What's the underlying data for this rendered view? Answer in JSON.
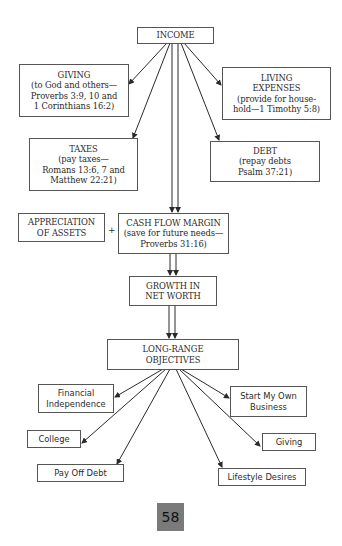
{
  "diagram": {
    "title_node": {
      "label": "INCOME"
    },
    "allocations": {
      "giving": {
        "lines": [
          "GIVING",
          "(to God and others—",
          "Proverbs 3:9, 10 and",
          "1 Corinthians 16:2)"
        ]
      },
      "living_expenses": {
        "lines": [
          "LIVING",
          "EXPENSES",
          "(provide for house-",
          "hold—1 Timothy 5:8)"
        ]
      },
      "taxes": {
        "lines": [
          "TAXES",
          "(pay taxes—",
          "Romans 13:6, 7 and",
          "Matthew 22:21)"
        ]
      },
      "debt": {
        "lines": [
          "DEBT",
          "(repay debts",
          "Psalm 37:21)"
        ]
      }
    },
    "appreciation": {
      "lines": [
        "APPRECIATION",
        "OF ASSETS"
      ]
    },
    "plus_sign": "+",
    "cash_flow_margin": {
      "lines": [
        "CASH FLOW MARGIN",
        "(save for future needs—",
        "Proverbs 31:16)"
      ]
    },
    "growth": {
      "lines": [
        "GROWTH IN",
        "NET WORTH"
      ]
    },
    "long_range": {
      "lines": [
        "LONG-RANGE",
        "OBJECTIVES"
      ]
    },
    "objectives": {
      "financial_independence": {
        "lines": [
          "Financial",
          "Independence"
        ]
      },
      "college": {
        "lines": [
          "College"
        ]
      },
      "pay_off_debt": {
        "lines": [
          "Pay Off Debt"
        ]
      },
      "start_business": {
        "lines": [
          "Start My Own",
          "Business"
        ]
      },
      "giving": {
        "lines": [
          "Giving"
        ]
      },
      "lifestyle": {
        "lines": [
          "Lifestyle Desires"
        ]
      }
    }
  },
  "page_number": "58",
  "colors": {
    "line": "#2a2a2a",
    "box_border": "#555555",
    "page_badge": "#7a7a7a"
  }
}
